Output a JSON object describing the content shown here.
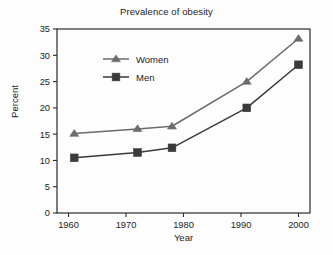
{
  "chart_data": {
    "type": "line",
    "title": "Prevalence of obesity",
    "xlabel": "Year",
    "ylabel": "Percent",
    "xlim": [
      1958,
      2002
    ],
    "ylim": [
      0,
      35
    ],
    "xticks": [
      "1960",
      "1970",
      "1980",
      "1990",
      "2000"
    ],
    "xtick_values": [
      1960,
      1970,
      1980,
      1990,
      2000
    ],
    "yticks": [
      "0",
      "5",
      "10",
      "15",
      "20",
      "25",
      "30",
      "35"
    ],
    "ytick_values": [
      0,
      5,
      10,
      15,
      20,
      25,
      30,
      35
    ],
    "grid": false,
    "legend_position": "upper-left-inside",
    "x": [
      1961,
      1972,
      1978,
      1991,
      2000
    ],
    "series": [
      {
        "name": "Women",
        "marker": "triangle",
        "color": "#6b6b6b",
        "values": [
          15.1,
          16.0,
          16.5,
          25.0,
          33.2
        ]
      },
      {
        "name": "Men",
        "marker": "square",
        "color": "#3a3a3a",
        "values": [
          10.5,
          11.5,
          12.4,
          20.0,
          28.2
        ]
      }
    ]
  },
  "legend": {
    "items": [
      {
        "label": "Women"
      },
      {
        "label": "Men"
      }
    ]
  },
  "colors": {
    "women_series": "#6b6b6b",
    "men_series": "#3a3a3a",
    "axis": "#2b2b2b",
    "background": "#fdfdfd"
  }
}
